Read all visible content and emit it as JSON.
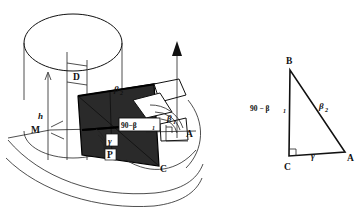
{
  "figure": {
    "colors": {
      "ink": "#111111",
      "plane_fill": "#2a2a2a",
      "background": "#ffffff",
      "label_box_fill": "#ffffff"
    },
    "left_diagram": {
      "name": "3d-construction",
      "points": [
        {
          "id": "D",
          "label": "D",
          "x": 78,
          "y": 71
        },
        {
          "id": "M",
          "label": "M",
          "x": 39,
          "y": 130
        },
        {
          "id": "A",
          "label": "A",
          "x": 189,
          "y": 134
        },
        {
          "id": "C",
          "label": "C",
          "x": 159,
          "y": 169
        },
        {
          "id": "P",
          "label": "P",
          "x": 110,
          "y": 157
        }
      ],
      "height_label": "h",
      "angles": [
        {
          "id": "beta2",
          "base": "β",
          "sub": "2",
          "x": 118,
          "y": 90
        },
        {
          "id": "beta1",
          "base": "β",
          "sub": "1",
          "x": 172,
          "y": 119
        },
        {
          "id": "gamma",
          "base": "γ",
          "sub": "",
          "x": 112,
          "y": 142
        }
      ],
      "boxed_label": {
        "text": "90−β",
        "sub": "1",
        "x": 124,
        "y": 127
      }
    },
    "right_diagram": {
      "name": "right-triangle",
      "vertices": [
        {
          "id": "B",
          "label": "B",
          "x": 290,
          "y": 62
        },
        {
          "id": "C",
          "label": "C",
          "x": 289,
          "y": 162
        },
        {
          "id": "A",
          "label": "A",
          "x": 347,
          "y": 160
        }
      ],
      "side_labels": [
        {
          "id": "side-BC",
          "text": "90 − β",
          "sub": "1",
          "x": 257,
          "y": 107
        },
        {
          "id": "side-BA",
          "base": "β",
          "sub": "2",
          "x": 322,
          "y": 106
        },
        {
          "id": "angle-C-bottom",
          "base": "γ",
          "sub": "",
          "x": 314,
          "y": 153
        }
      ],
      "right_angle_at": "C"
    }
  }
}
